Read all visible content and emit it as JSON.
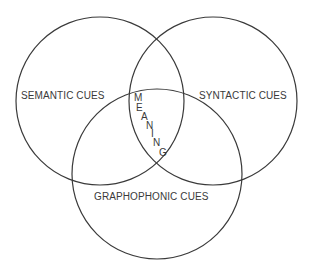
{
  "diagram": {
    "type": "venn",
    "circles": [
      {
        "id": "semantic",
        "label": "SEMANTIC CUES",
        "cx": 100,
        "cy": 101,
        "r": 84
      },
      {
        "id": "syntactic",
        "label": "SYNTACTIC CUES",
        "cx": 213,
        "cy": 101,
        "r": 84
      },
      {
        "id": "graphophonic",
        "label": "GRAPHOPHONIC CUES",
        "cx": 157,
        "cy": 174,
        "r": 85
      }
    ],
    "center_label": "MEANING",
    "center_letters": [
      "M",
      "E",
      "A",
      "N",
      "I",
      "N",
      "G"
    ],
    "colors": {
      "stroke": "#3a3a3a",
      "text": "#3a3a3a",
      "background": "#ffffff"
    }
  }
}
